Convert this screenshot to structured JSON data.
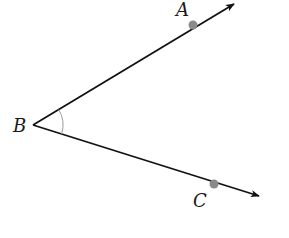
{
  "diagram": {
    "type": "angle",
    "vertex": {
      "label": "B",
      "x": 33,
      "y": 125
    },
    "rays": [
      {
        "name": "ray-BA",
        "from": "B",
        "through": "A",
        "end": {
          "x": 235,
          "y": 3
        }
      },
      {
        "name": "ray-BC",
        "from": "B",
        "through": "C",
        "end": {
          "x": 260,
          "y": 197
        }
      }
    ],
    "points": [
      {
        "label": "A",
        "x": 193,
        "y": 25,
        "label_x": 176,
        "label_y": 1
      },
      {
        "label": "B",
        "x": 33,
        "y": 125,
        "label_x": 13,
        "label_y": 117
      },
      {
        "label": "C",
        "x": 214,
        "y": 184,
        "label_x": 193,
        "label_y": 192
      }
    ],
    "angle_arc": {
      "center": "B",
      "radius": 30
    },
    "colors": {
      "line": "#111111",
      "point": "#8a8a8a",
      "arc": "#9a9a9a",
      "label": "#1a1a1a"
    }
  }
}
